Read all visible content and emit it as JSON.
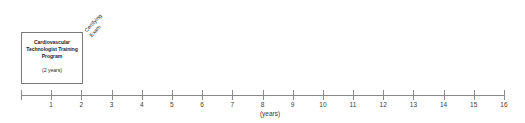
{
  "figure": {
    "background_color": "#ffffff",
    "line_color": "#8a8a8a",
    "text_color": "#1d1d1d"
  },
  "program_box": {
    "title": "Cardiovascular Technologist Training Program",
    "duration": "(2 years)"
  },
  "milestones": [
    {
      "name": "certifying-exam",
      "line1": "Certifying",
      "line2": "Exam",
      "at_year": 2
    }
  ],
  "chart_data": {
    "type": "timeline",
    "title": "",
    "xlabel": "(years)",
    "ylabel": "",
    "xlim": [
      0,
      16
    ],
    "grid": false,
    "tick_values": [
      0,
      1,
      2,
      3,
      4,
      5,
      6,
      7,
      8,
      9,
      10,
      11,
      12,
      13,
      14,
      15,
      16
    ],
    "tick_labels": [
      "",
      "1",
      "2",
      "3",
      "4",
      "5",
      "6",
      "7",
      "8",
      "9",
      "10",
      "11",
      "12",
      "13",
      "14",
      "15",
      "16"
    ],
    "spans": [
      {
        "label": "Cardiovascular Technologist Training Program",
        "sublabel": "(2 years)",
        "start": 0,
        "end": 2
      }
    ],
    "events": [
      {
        "label": "Certifying Exam",
        "at": 2
      }
    ]
  }
}
